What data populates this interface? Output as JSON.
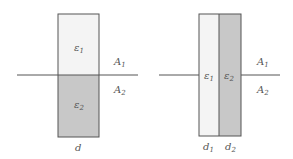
{
  "colors": {
    "line": "#555555",
    "dielectric_1_fill": "#f4f4f4",
    "dielectric_2_fill": "#c8c8c8",
    "text": "#555555"
  },
  "left_figure": {
    "dielectric_top": {
      "symbol": "ε",
      "subscript": "1"
    },
    "dielectric_bottom": {
      "symbol": "ε",
      "subscript": "2"
    },
    "area_top": {
      "symbol": "A",
      "subscript": "1"
    },
    "area_bottom": {
      "symbol": "A",
      "subscript": "2"
    },
    "thickness": {
      "symbol": "d"
    }
  },
  "right_figure": {
    "dielectric_left": {
      "symbol": "ε",
      "subscript": "1"
    },
    "dielectric_right": {
      "symbol": "ε",
      "subscript": "2"
    },
    "area_top": {
      "symbol": "A",
      "subscript": "1"
    },
    "area_bottom": {
      "symbol": "A",
      "subscript": "2"
    },
    "thickness_left": {
      "symbol": "d",
      "subscript": "1"
    },
    "thickness_right": {
      "symbol": "d",
      "subscript": "2"
    }
  }
}
